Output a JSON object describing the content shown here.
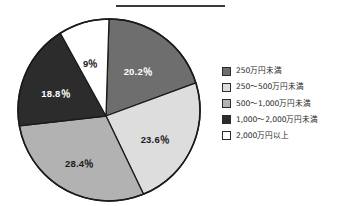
{
  "figure": {
    "has_top_rule": true,
    "background_color": "#ffffff"
  },
  "legend": {
    "position": "right",
    "items": [
      {
        "label": "250万円未満",
        "color": "#6e6e6e"
      },
      {
        "label": "250〜500万円未満",
        "color": "#dddddd"
      },
      {
        "label": "500〜1,000万円未満",
        "color": "#b2b2b2"
      },
      {
        "label": "1,000〜2,000万円未満",
        "color": "#2c2c2c"
      },
      {
        "label": "2,000万円以上",
        "color": "#ffffff"
      }
    ]
  },
  "chart_data": {
    "type": "pie",
    "title": "",
    "categories": [
      "250万円未満",
      "250〜500万円未満",
      "500〜1,000万円未満",
      "1,000〜2,000万円未満",
      "2,000万円以上"
    ],
    "values": [
      20.2,
      23.6,
      28.4,
      18.8,
      9.0
    ],
    "data_labels": [
      "20.2％",
      "23.6％",
      "28.4％",
      "18.8％",
      "9％"
    ],
    "colors": [
      "#6e6e6e",
      "#dddddd",
      "#b2b2b2",
      "#2c2c2c",
      "#ffffff"
    ],
    "label_text_colors": [
      "#ffffff",
      "#1a1a1a",
      "#1a1a1a",
      "#ffffff",
      "#1a1a1a"
    ],
    "units": "percent",
    "start_angle_deg": 0,
    "direction": "clockwise",
    "legend_position": "right",
    "grid": false
  }
}
